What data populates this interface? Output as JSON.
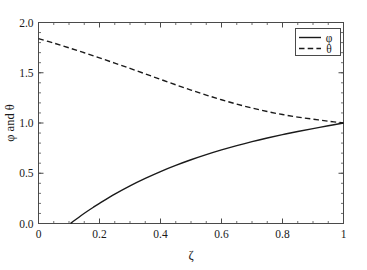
{
  "chart_data": {
    "type": "line",
    "title": "",
    "xlabel": "ζ",
    "ylabel": "φ and θ",
    "xlim": [
      0,
      1
    ],
    "ylim": [
      0,
      2
    ],
    "grid": false,
    "legend_position": "top-right",
    "x_major_ticks": [
      0,
      0.2,
      0.4,
      0.6,
      0.8,
      1
    ],
    "x_tick_labels": [
      "0",
      "0.2",
      "0.4",
      "0.6",
      "0.8",
      "1"
    ],
    "x_minor_step": 0.05,
    "y_major_ticks": [
      0,
      0.5,
      1,
      1.5,
      2
    ],
    "y_tick_labels": [
      "0.0",
      "0.5",
      "1.0",
      "1.5",
      "2.0"
    ],
    "y_minor_step": 0.1,
    "series": [
      {
        "name": "φ",
        "style": "solid",
        "color": "#1a1a1a",
        "x": [
          0.105,
          0.12,
          0.14,
          0.16,
          0.18,
          0.2,
          0.25,
          0.3,
          0.35,
          0.4,
          0.45,
          0.5,
          0.55,
          0.6,
          0.65,
          0.7,
          0.75,
          0.8,
          0.85,
          0.9,
          0.95,
          1.0
        ],
        "values": [
          0.0,
          0.035,
          0.08,
          0.122,
          0.162,
          0.2,
          0.292,
          0.375,
          0.449,
          0.517,
          0.578,
          0.634,
          0.685,
          0.732,
          0.775,
          0.815,
          0.851,
          0.884,
          0.915,
          0.944,
          0.973,
          1.0
        ]
      },
      {
        "name": "θ",
        "style": "dashed",
        "color": "#1a1a1a",
        "x": [
          0.0,
          0.05,
          0.1,
          0.15,
          0.2,
          0.25,
          0.3,
          0.35,
          0.4,
          0.45,
          0.5,
          0.55,
          0.6,
          0.65,
          0.7,
          0.75,
          0.8,
          0.85,
          0.9,
          0.95,
          1.0
        ],
        "values": [
          1.84,
          1.795,
          1.748,
          1.699,
          1.648,
          1.596,
          1.543,
          1.489,
          1.434,
          1.38,
          1.328,
          1.278,
          1.231,
          1.188,
          1.149,
          1.114,
          1.084,
          1.059,
          1.038,
          1.018,
          1.0
        ]
      }
    ],
    "legend_entries": [
      {
        "label": "φ",
        "style": "solid"
      },
      {
        "label": "θ",
        "style": "dashed"
      }
    ]
  },
  "axes": {
    "x_title": "ζ",
    "y_title": "φ and θ"
  }
}
